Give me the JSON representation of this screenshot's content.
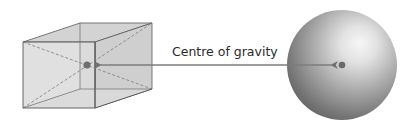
{
  "diagram": {
    "label": "Centre of gravity",
    "shapes": [
      {
        "type": "cuboid",
        "name": "box",
        "center_of_gravity": "intersection of diagonals"
      },
      {
        "type": "sphere",
        "name": "ball",
        "center_of_gravity": "geometric centre"
      }
    ],
    "colors": {
      "cube_fill": "#d6d6d6",
      "cube_edge": "#5a5a5a",
      "diagonal": "#7a7a7a",
      "dot": "#6e6e6e",
      "arrow": "#7c7c7c",
      "sphere_dark": "#5c5c5c",
      "sphere_light": "#f4f4f4",
      "text": "#2a2a2a"
    }
  }
}
